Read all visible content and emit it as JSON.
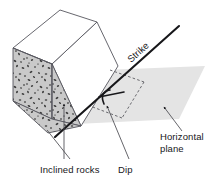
{
  "figure": {
    "type": "geological-block-diagram",
    "labels": {
      "strike": "Strike",
      "dip": "Dip",
      "inclined_rocks": "Inclined rocks",
      "horizontal_plane_line1": "Horizontal",
      "horizontal_plane_line2": "plane"
    },
    "colors": {
      "background": "#ffffff",
      "block_top_face": "#ffffff",
      "stipple_base": "#c9c9c9",
      "stipple_dots": "#3a3a3a",
      "horizontal_plane": "#e4e4e4",
      "outline": "#4a4a50",
      "strike_line": "#17171a",
      "text": "#17171a",
      "dashed_line": "#5a5a60"
    },
    "geometry": {
      "block_top_face": "13,48 60,10 97,22 52,64",
      "block_left_face": "13,48 52,64 52,118 13,100",
      "block_front_face": "52,64 97,22 118,66 81,126",
      "strike_line_start": "178,27",
      "strike_line_end": "56,136",
      "horizontal_plane": "104,70 205,66 178,118 76,124",
      "dashed_rect": "108,70 143,82 122,117 92,106"
    },
    "annotations": {
      "dip_angle_marker": "arc between strike line and horizontal tick",
      "inclined_rocks_leaders": 2,
      "dip_leader": 1,
      "horizontal_plane_leader": 1
    }
  }
}
